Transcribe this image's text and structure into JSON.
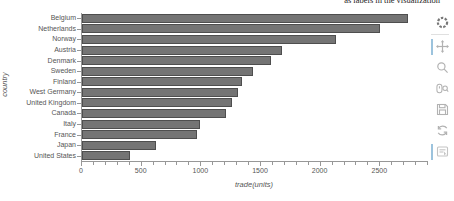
{
  "caption": {
    "text": "as labels in the visualization"
  },
  "chart_data": {
    "type": "bar",
    "orientation": "horizontal",
    "title": "",
    "xlabel": "trade(units)",
    "ylabel": "country",
    "xlim": [
      0,
      2900
    ],
    "xticks": [
      0,
      500,
      1000,
      1500,
      2000,
      2500
    ],
    "minor_tick_step": 100,
    "grid": false,
    "legend": "none",
    "categories": [
      "Belgium",
      "Netherlands",
      "Norway",
      "Austria",
      "Denmark",
      "Sweden",
      "Finland",
      "West Germany",
      "United Kingdom",
      "Canada",
      "Italy",
      "France",
      "Japan",
      "United States"
    ],
    "values": [
      2730,
      2500,
      2130,
      1680,
      1580,
      1430,
      1340,
      1310,
      1260,
      1210,
      990,
      960,
      620,
      400
    ],
    "bar_color": "#747474",
    "bar_border_color": "#4e4e4e"
  },
  "toolbar": {
    "active_color": "#9cc3dd",
    "icon_color": "#b2b2b2",
    "logo_color": "#777777",
    "tools": [
      {
        "id": "bokeh-logo",
        "active": false
      },
      {
        "id": "pan",
        "active": true
      },
      {
        "id": "box-zoom",
        "active": false
      },
      {
        "id": "wheel-zoom",
        "active": false
      },
      {
        "id": "save",
        "active": false
      },
      {
        "id": "reset",
        "active": false
      },
      {
        "id": "hover",
        "active": true
      }
    ]
  }
}
